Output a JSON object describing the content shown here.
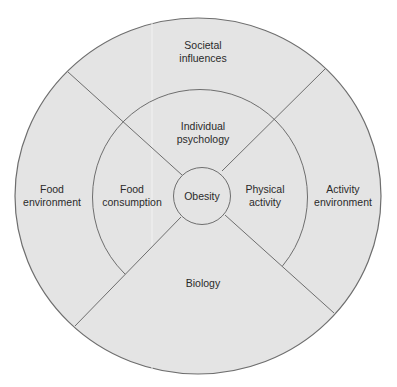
{
  "diagram": {
    "type": "concentric-circle-segmented",
    "colors": {
      "background": "#ffffff",
      "fill": "#e4e4e4",
      "stroke": "#6e6e6e",
      "text": "#2a2a2a"
    },
    "center": {
      "label": "Obesity"
    },
    "inner_ring": [
      {
        "id": "individual-psychology",
        "lines": [
          "Individual",
          "psychology"
        ],
        "position": "top"
      },
      {
        "id": "physical-activity",
        "lines": [
          "Physical",
          "activity"
        ],
        "position": "right"
      },
      {
        "id": "biology",
        "lines": [
          "Biology"
        ],
        "position": "bottom",
        "spans_both_rings": true
      },
      {
        "id": "food-consumption",
        "lines": [
          "Food",
          "consumption"
        ],
        "position": "left"
      }
    ],
    "outer_ring": [
      {
        "id": "societal-influences",
        "lines": [
          "Societal",
          "influences"
        ],
        "position": "top"
      },
      {
        "id": "activity-environment",
        "lines": [
          "Activity",
          "environment"
        ],
        "position": "right"
      },
      {
        "id": "food-environment",
        "lines": [
          "Food",
          "environment"
        ],
        "position": "left"
      }
    ]
  }
}
